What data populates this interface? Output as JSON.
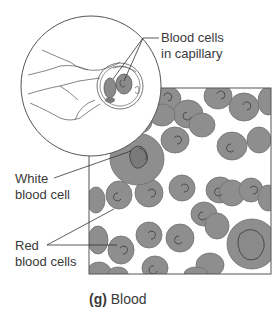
{
  "figure": {
    "caption_letter": "(g)",
    "caption_text": "Blood",
    "labels": {
      "capillary_line1": "Blood cells",
      "capillary_line2": "in capillary",
      "wbc_line1": "White",
      "wbc_line2": "blood cell",
      "rbc_line1": "Red",
      "rbc_line2": "blood cells"
    },
    "colors": {
      "cell_fill": "#8e8e8e",
      "cell_edge": "#6f6f6f",
      "outline": "#555555",
      "background": "#ffffff"
    }
  }
}
